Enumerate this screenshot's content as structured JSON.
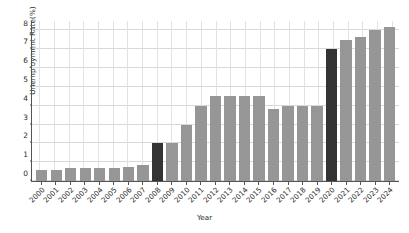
{
  "chart_data": {
    "type": "bar",
    "title": "",
    "xlabel": "Year",
    "ylabel": "Unemployment Rate(%)",
    "categories": [
      "2000",
      "2001",
      "2002",
      "2003",
      "2004",
      "2005",
      "2006",
      "2007",
      "2008",
      "2009",
      "2010",
      "2011",
      "2012",
      "2013",
      "2014",
      "2015",
      "2016",
      "2017",
      "2018",
      "2019",
      "2020",
      "2021",
      "2022",
      "2023",
      "2024"
    ],
    "values": [
      0.6,
      0.6,
      0.7,
      0.7,
      0.7,
      0.7,
      0.75,
      0.85,
      2.0,
      2.0,
      3.0,
      4.0,
      4.5,
      4.5,
      4.5,
      4.5,
      3.8,
      4.0,
      4.0,
      4.0,
      7.0,
      7.5,
      7.65,
      8.0,
      8.2
    ],
    "highlight_categories": [
      "2008",
      "2020"
    ],
    "bar_color": "#969696",
    "highlight_color": "#333333",
    "ylim": [
      0,
      8.5
    ],
    "yticks": [
      0,
      1,
      2,
      3,
      4,
      5,
      6,
      7,
      8
    ],
    "ytick_labels": [
      "0",
      "1",
      "2",
      "3",
      "4",
      "5",
      "6",
      "7",
      "8"
    ],
    "grid": true,
    "legend": null
  }
}
